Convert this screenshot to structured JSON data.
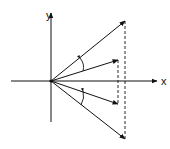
{
  "diagram": {
    "title": "",
    "colors": {
      "ink": "#111111",
      "background": "#ffffff"
    },
    "axes": {
      "x_label": "x",
      "y_label": "y"
    },
    "origin": [
      51,
      81
    ],
    "vectors": [
      {
        "name": "long-upper",
        "end": [
          125,
          21
        ]
      },
      {
        "name": "short-upper",
        "end": [
          118,
          60
        ]
      },
      {
        "name": "short-lower",
        "end": [
          118,
          104
        ]
      },
      {
        "name": "long-lower",
        "end": [
          125,
          139
        ]
      }
    ],
    "dashed_lines": [
      {
        "x": 125,
        "y1": 21,
        "y2": 139
      },
      {
        "x": 118,
        "y1": 60,
        "y2": 104
      }
    ],
    "angle_arcs": [
      {
        "name": "upper-angle",
        "between": [
          "long-upper",
          "short-upper"
        ]
      },
      {
        "name": "lower-angle",
        "between": [
          "short-lower",
          "long-lower"
        ]
      }
    ]
  }
}
